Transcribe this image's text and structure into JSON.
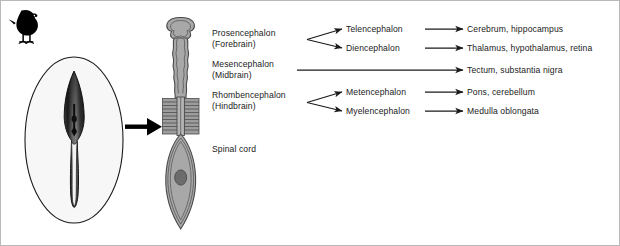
{
  "figure": {
    "title_visible": false,
    "background_color": "#ffffff",
    "border_color": "#b9b9b9"
  },
  "organism": {
    "icon": "chick-silhouette",
    "color": "#000000"
  },
  "embryo_panel": {
    "name": "chick-embryo-in-yolk",
    "outer_shape": "egg-oval",
    "outer_fill": "#f7f7f7",
    "outer_stroke": "#1a1a1a",
    "embryo_fill_dark": "#2b2b2b",
    "embryo_fill_mid": "#777777",
    "embryo_fill_light": "#e6e6e6"
  },
  "transition_arrow": {
    "name": "embryo-to-neural-tube-arrow",
    "color": "#000000"
  },
  "neural_tube_panel": {
    "name": "neural-tube-diagram",
    "fill": "#a8a8a8",
    "stroke": "#4a4a4a",
    "somite_fill": "#9a9a9a",
    "eye_fill": "#6a6a6a"
  },
  "regions": [
    {
      "id": "prosencephalon",
      "label": "Prosencephalon",
      "sublabel": "(Forebrain)",
      "x": 211,
      "y": 27
    },
    {
      "id": "mesencephalon",
      "label": "Mesencephalon",
      "sublabel": "(Midbrain)",
      "x": 211,
      "y": 58
    },
    {
      "id": "rhombencephalon",
      "label": "Rhombencephalon",
      "sublabel": "(Hindbrain)",
      "x": 211,
      "y": 89
    },
    {
      "id": "spinal-cord",
      "label": "Spinal cord",
      "sublabel": "",
      "x": 211,
      "y": 143
    }
  ],
  "subdivisions": [
    {
      "id": "telencephalon",
      "label": "Telencephalon",
      "x": 345,
      "y": 29
    },
    {
      "id": "diencephalon",
      "label": "Diencephalon",
      "x": 345,
      "y": 48
    },
    {
      "id": "metencephalon",
      "label": "Metencephalon",
      "x": 345,
      "y": 92
    },
    {
      "id": "myelencephalon",
      "label": "Myelencephalon",
      "x": 345,
      "y": 111
    }
  ],
  "derivatives": [
    {
      "id": "telencephalon-derivative",
      "label": "Cerebrum, hippocampus",
      "x": 466,
      "y": 29
    },
    {
      "id": "diencephalon-derivative",
      "label": "Thalamus, hypothalamus, retina",
      "x": 466,
      "y": 48
    },
    {
      "id": "mesencephalon-derivative",
      "label": "Tectum, substantia nigra",
      "x": 466,
      "y": 70
    },
    {
      "id": "metencephalon-derivative",
      "label": "Pons, cerebellum",
      "x": 466,
      "y": 92
    },
    {
      "id": "myelencephalon-derivative",
      "label": "Medulla oblongata",
      "x": 466,
      "y": 111
    }
  ],
  "connectors": {
    "fork_arrow_color": "#1a1a1a",
    "straight_arrow_color": "#1a1a1a",
    "items": [
      {
        "id": "prosencephalon-to-telencephalon",
        "type": "fork-upper"
      },
      {
        "id": "prosencephalon-to-diencephalon",
        "type": "fork-lower"
      },
      {
        "id": "mesencephalon-to-tectum",
        "type": "long-straight"
      },
      {
        "id": "rhombencephalon-to-metencephalon",
        "type": "fork-upper"
      },
      {
        "id": "rhombencephalon-to-myelencephalon",
        "type": "fork-lower"
      },
      {
        "id": "telencephalon-to-derivative",
        "type": "straight"
      },
      {
        "id": "diencephalon-to-derivative",
        "type": "straight"
      },
      {
        "id": "metencephalon-to-derivative",
        "type": "straight"
      },
      {
        "id": "myelencephalon-to-derivative",
        "type": "straight"
      }
    ]
  }
}
